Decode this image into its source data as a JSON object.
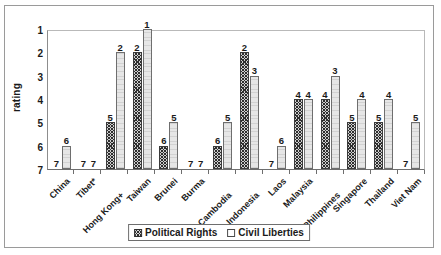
{
  "chart_data": {
    "type": "bar",
    "title": "",
    "xlabel": "",
    "ylabel": "rating",
    "ylim": [
      7,
      1
    ],
    "y_inverted": true,
    "y_ticks": [
      1,
      2,
      3,
      4,
      5,
      6,
      7
    ],
    "grid": false,
    "legend_position": "bottom-center",
    "categories": [
      "China",
      "Tibet*",
      "Hong Kong+",
      "Taiwan",
      "Brunei",
      "Burma",
      "Cambodia",
      "Indonesia",
      "Laos",
      "Malaysia",
      "Philippines",
      "Singapore",
      "Thailand",
      "Viet Nam"
    ],
    "series": [
      {
        "name": "Political Rights",
        "values": [
          7,
          7,
          5,
          2,
          6,
          7,
          6,
          2,
          7,
          4,
          4,
          5,
          5,
          7
        ]
      },
      {
        "name": "Civil Liberties",
        "values": [
          6,
          7,
          2,
          1,
          5,
          7,
          5,
          3,
          6,
          4,
          3,
          4,
          4,
          5
        ]
      }
    ]
  },
  "legend": {
    "items": [
      {
        "label": "Political Rights",
        "swatch": "hatched-swatch"
      },
      {
        "label": "Civil Liberties",
        "swatch": "open-swatch"
      }
    ]
  }
}
